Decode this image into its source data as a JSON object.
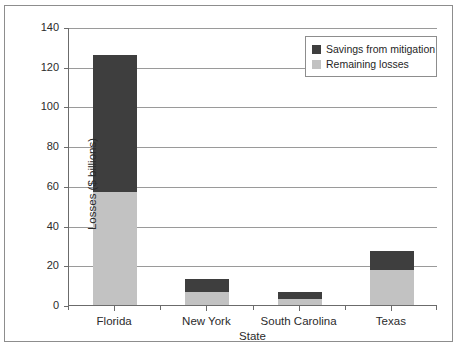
{
  "chart_data": {
    "type": "bar",
    "subtype": "stacked",
    "title": "",
    "xlabel": "State",
    "ylabel": "Losses ($ billions)",
    "categories": [
      "Florida",
      "New York",
      "South Carolina",
      "Texas"
    ],
    "series": [
      {
        "name": "Remaining losses",
        "color": "#c2c2c2",
        "values": [
          57,
          6.5,
          3,
          17.5
        ]
      },
      {
        "name": "Savings from mitigation",
        "color": "#3e3e3e",
        "values": [
          69,
          6.5,
          3.5,
          9.5
        ]
      }
    ],
    "totals": [
      126,
      13,
      6.5,
      27
    ],
    "ylim": [
      0,
      140
    ],
    "yticks": [
      0,
      20,
      40,
      60,
      80,
      100,
      120,
      140
    ],
    "ytick_labels": [
      "0",
      "20",
      "40",
      "60",
      "80",
      "100",
      "120",
      "140"
    ],
    "grid": true,
    "grid_axis": "y",
    "legend_position": "top-right",
    "legend_entries": [
      {
        "label": "Savings from mitigation",
        "color": "#3e3e3e"
      },
      {
        "label": "Remaining losses",
        "color": "#c2c2c2"
      }
    ]
  },
  "colors": {
    "savings": "#3e3e3e",
    "remaining": "#c2c2c2",
    "axis": "#6b6b6b",
    "grid": "#9a9a9a",
    "text": "#2b2b2b",
    "background": "#ffffff"
  }
}
